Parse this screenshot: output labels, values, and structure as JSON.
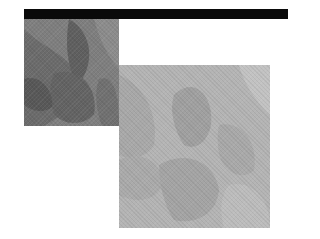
{
  "header_bar": {
    "color": "#0a0a0a"
  },
  "images": [
    {
      "name": "dark-leaf-tile",
      "tone": "#7e7e7e",
      "shade": "#5f5f5f",
      "highlight": "#9a9a9a"
    },
    {
      "name": "light-leaf-tile",
      "tone": "#b4b4b4",
      "shade": "#9c9c9c",
      "highlight": "#c8c8c8"
    }
  ]
}
